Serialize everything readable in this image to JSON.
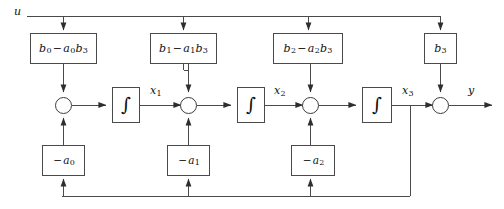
{
  "figure": {
    "width": 504,
    "height": 209,
    "line_color": "#4a4a4a",
    "text_color": "#111111",
    "background": "#ffffff"
  },
  "signals": {
    "input": "u",
    "output": "y",
    "state_1": "x",
    "state_1_sub": "1",
    "state_2": "x",
    "state_2_sub": "2",
    "state_3": "x",
    "state_3_sub": "3"
  },
  "feedforward_blocks": [
    {
      "name": "b0-a0b3",
      "b": "b",
      "b_sub": "0",
      "op": "−",
      "a": "a",
      "a_sub": "0",
      "bb": "b",
      "bb_sub": "3"
    },
    {
      "name": "b1-a1b3",
      "b": "b",
      "b_sub": "1",
      "op": "−",
      "a": "a",
      "a_sub": "1",
      "bb": "b",
      "bb_sub": "3"
    },
    {
      "name": "b2-a2b3",
      "b": "b",
      "b_sub": "2",
      "op": "−",
      "a": "a",
      "a_sub": "2",
      "bb": "b",
      "bb_sub": "3"
    }
  ],
  "direct_block": {
    "name": "b3",
    "b": "b",
    "b_sub": "3"
  },
  "feedback_blocks": [
    {
      "name": "-a0",
      "op": "−",
      "a": "a",
      "a_sub": "0"
    },
    {
      "name": "-a1",
      "op": "−",
      "a": "a",
      "a_sub": "1"
    },
    {
      "name": "-a2",
      "op": "−",
      "a": "a",
      "a_sub": "2"
    }
  ],
  "integrators": [
    {
      "name": "integrator-1",
      "glyph": "∫"
    },
    {
      "name": "integrator-2",
      "glyph": "∫"
    },
    {
      "name": "integrator-3",
      "glyph": "∫"
    }
  ],
  "junctions": [
    {
      "name": "sum-1"
    },
    {
      "name": "sum-2"
    },
    {
      "name": "sum-3"
    },
    {
      "name": "sum-output"
    }
  ]
}
